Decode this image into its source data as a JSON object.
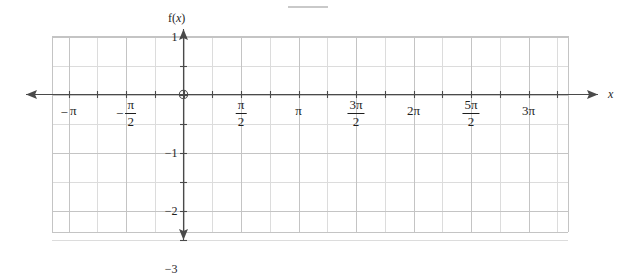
{
  "figure": {
    "kind": "coordinate-grid",
    "background_color": "#ffffff",
    "width": 624,
    "height": 255
  },
  "axes": {
    "x_axis_label": "x",
    "y_axis_label_parts": {
      "f": "f(",
      "x": "x",
      "close": ")"
    },
    "y_axis_label_text": "f(x)",
    "origin_marker": "open-circle",
    "axis_color": "#4a4a4a",
    "grid_minor_color": "#dcdcdc",
    "grid_major_color": "#c4c4c4"
  },
  "chart_data": {
    "type": "line",
    "title": "",
    "subtitle": "",
    "xlabel": "x",
    "ylabel": "f(x)",
    "grid": true,
    "legend": "none",
    "series": [],
    "annotations": [],
    "x_unit": "pi",
    "xlim": [
      -1.375,
      3.375
    ],
    "ylim": [
      -3,
      1
    ],
    "x_major_step_pi": 0.5,
    "y_major_step": 1,
    "x_minor_step_pi": 0.25,
    "y_minor_step": 0.5,
    "xticks": [
      {
        "value_pi": -1,
        "label": "-π",
        "form": "plain",
        "sign": "-",
        "numerator": "π",
        "denominator": ""
      },
      {
        "value_pi": -0.5,
        "label": "-π/2",
        "form": "fraction",
        "sign": "-",
        "numerator": "π",
        "denominator": "2"
      },
      {
        "value_pi": 0.5,
        "label": "π/2",
        "form": "fraction",
        "sign": "",
        "numerator": "π",
        "denominator": "2"
      },
      {
        "value_pi": 1,
        "label": "π",
        "form": "plain",
        "sign": "",
        "numerator": "π",
        "denominator": ""
      },
      {
        "value_pi": 1.5,
        "label": "3π/2",
        "form": "fraction",
        "sign": "",
        "numerator": "3π",
        "denominator": "2"
      },
      {
        "value_pi": 2,
        "label": "2π",
        "form": "plain",
        "sign": "",
        "numerator": "2π",
        "denominator": ""
      },
      {
        "value_pi": 2.5,
        "label": "5π/2",
        "form": "fraction",
        "sign": "",
        "numerator": "5π",
        "denominator": "2"
      },
      {
        "value_pi": 3,
        "label": "3π",
        "form": "plain",
        "sign": "",
        "numerator": "3π",
        "denominator": ""
      }
    ],
    "yticks": [
      {
        "value": 1,
        "label": "1"
      },
      {
        "value": -1,
        "label": "-1"
      },
      {
        "value": -2,
        "label": "-2"
      },
      {
        "value": -3,
        "label": "-3"
      }
    ]
  },
  "artifact": {
    "top_line_note": "faint gray horizontal mark near top center"
  }
}
